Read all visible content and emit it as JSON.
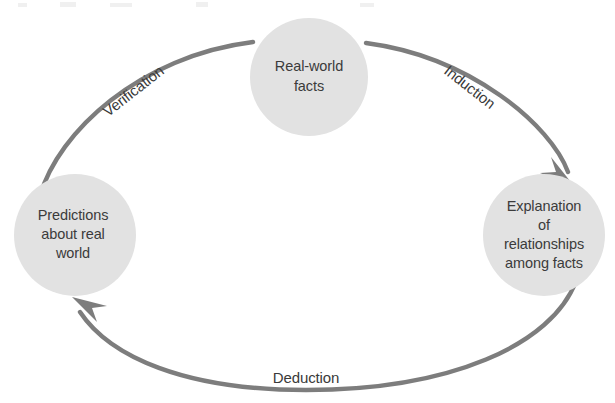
{
  "diagram": {
    "colors": {
      "node_fill": "#e2e2e2",
      "node_text": "#3b3b3b",
      "edge_stroke": "#7d7d7d",
      "edge_text": "#3a3a3a",
      "background": "#ffffff"
    },
    "nodes": [
      {
        "id": "real-world-facts",
        "name": "real-world-facts-node",
        "lines": [
          "Real-world",
          "facts"
        ],
        "cx": 309,
        "cy": 77,
        "r": 59
      },
      {
        "id": "explanation",
        "name": "explanation-node",
        "lines": [
          "Explanation",
          "of",
          "relationships",
          "among facts"
        ],
        "cx": 544,
        "cy": 235,
        "r": 61
      },
      {
        "id": "predictions",
        "name": "predictions-node",
        "lines": [
          "Predictions",
          "about real",
          "world"
        ],
        "cx": 75,
        "cy": 235,
        "r": 61
      }
    ],
    "edges": [
      {
        "id": "induction",
        "name": "induction-edge",
        "label": "Induction",
        "from": "real-world-facts",
        "to": "explanation",
        "label_x": 469,
        "label_y": 88,
        "label_rotation": 38,
        "arrowhead": true
      },
      {
        "id": "deduction",
        "name": "deduction-edge",
        "label": "Deduction",
        "from": "explanation",
        "to": "predictions",
        "label_x": 306,
        "label_y": 379,
        "label_rotation": 0,
        "arrowhead": true
      },
      {
        "id": "verification",
        "name": "verification-edge",
        "label": "Verification",
        "from": "predictions",
        "to": "real-world-facts",
        "label_x": 134,
        "label_y": 92,
        "label_rotation": -38,
        "arrowhead": false
      }
    ]
  }
}
